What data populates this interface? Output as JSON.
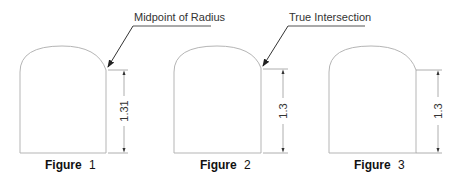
{
  "figures": [
    {
      "caption_word": "Figure",
      "caption_number": "1",
      "dimension_value": "1.31",
      "callout": "Midpoint of Radius"
    },
    {
      "caption_word": "Figure",
      "caption_number": "2",
      "dimension_value": "1.3",
      "callout": "True Intersection"
    },
    {
      "caption_word": "Figure",
      "caption_number": "3",
      "dimension_value": "1.3",
      "callout": ""
    }
  ],
  "colors": {
    "outline": "#b5b5b5",
    "leader": "#333333",
    "text": "#333333",
    "background": "#ffffff"
  }
}
